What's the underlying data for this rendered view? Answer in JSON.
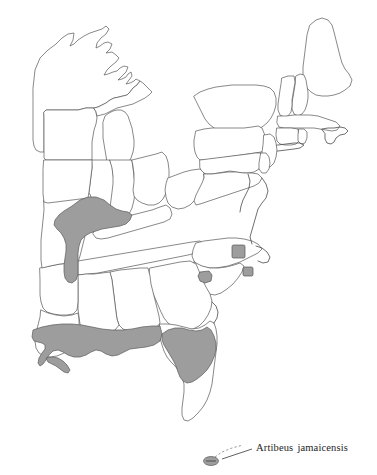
{
  "figure": {
    "type": "distribution-range-map",
    "region_depicted": "Eastern United States",
    "background_color": "#ffffff",
    "outline_color": "#565656",
    "range_fill_color": "#9d9d9d",
    "range_outline_color": "#5a5a5a",
    "label_text_color": "#1d1d1d"
  },
  "label": {
    "genus": "Artibeus",
    "species": "jamaicensis",
    "full": "Artibeus jamaicensis"
  },
  "legend_semantics": {
    "shaded_area_meaning": "distribution range",
    "small_square_meaning": "isolated record locality"
  },
  "range_areas": [
    {
      "name": "lower-midwest-range",
      "description": "Southern Missouri, southern Illinois and western Kentucky shaded band"
    },
    {
      "name": "gulf-coast-range",
      "description": "Continuous band along the Gulf Coast from Louisiana through the Florida panhandle"
    },
    {
      "name": "florida-peninsula-range",
      "description": "Northern and central Florida peninsula"
    },
    {
      "name": "island-record",
      "description": "Small shaded island key south of Florida connected to the label"
    }
  ],
  "locality_markers": [
    {
      "name": "locality-marker-north-carolina"
    },
    {
      "name": "locality-marker-coastal-carolina"
    },
    {
      "name": "locality-marker-south-carolina"
    }
  ]
}
